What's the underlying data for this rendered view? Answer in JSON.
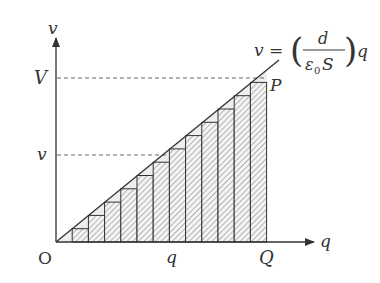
{
  "diagram": {
    "axes": {
      "y_label": "v",
      "x_label": "q",
      "origin_label": "O"
    },
    "ticks": {
      "y_top_label": "V",
      "y_mid_label": "v",
      "x_mid_label": "q",
      "x_end_label": "Q"
    },
    "point_label": "P",
    "equation": {
      "lhs": "v =",
      "numerator": "d",
      "denominator_eps": "ε",
      "denominator_sub": "0",
      "denominator_rest": "S",
      "rhs": "q"
    },
    "bars": {
      "count": 12,
      "fill_pattern": "diagonal-hatch"
    },
    "colors": {
      "stroke": "#333333",
      "hatch": "#777777",
      "gap_fill": "#eeeeee"
    }
  }
}
